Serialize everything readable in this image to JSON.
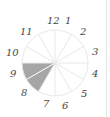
{
  "diagram": {
    "type": "clock-fraction-circle",
    "sectors": 12,
    "shaded_sectors": [
      "9-8",
      "8-7"
    ],
    "shaded_color": "#a6a6a6",
    "line_color": "#e8e8e8",
    "labels": [
      "12",
      "1",
      "2",
      "3",
      "4",
      "5",
      "6",
      "7",
      "8",
      "9",
      "10",
      "11"
    ]
  }
}
